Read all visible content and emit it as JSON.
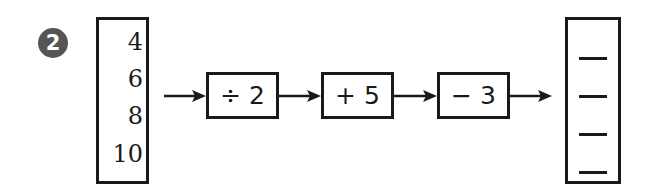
{
  "problem": {
    "number": "2",
    "inputs": [
      "4",
      "6",
      "8",
      "10"
    ],
    "operations": [
      "÷ 2",
      "+ 5",
      "− 3"
    ],
    "outputs": [
      "—",
      "—",
      "—",
      "—"
    ]
  },
  "colors": {
    "ink": "#1a1a1a",
    "badge": "#555555"
  }
}
